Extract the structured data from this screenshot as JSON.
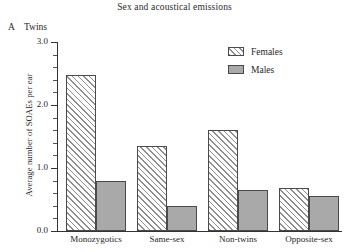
{
  "panel": {
    "letter": "A",
    "name": "Twins"
  },
  "chart_data": {
    "type": "bar",
    "title": "Sex and acoustical emissions",
    "xlabel": "",
    "ylabel": "Average number of SOAEs per ear",
    "categories": [
      "Monozygotics",
      "Same-sex",
      "Non-twins",
      "Opposite-sex"
    ],
    "series": [
      {
        "name": "Females",
        "values": [
          2.48,
          1.35,
          1.6,
          0.68
        ],
        "fill": "diagonal-hatch"
      },
      {
        "name": "Males",
        "values": [
          0.8,
          0.4,
          0.65,
          0.55
        ],
        "fill": "solid-gray"
      }
    ],
    "ylim": [
      0.0,
      3.0
    ],
    "ytick_labels": [
      "0.0",
      "1.0",
      "2.0",
      "3.0"
    ],
    "ytick_values": [
      0.0,
      1.0,
      2.0,
      3.0
    ],
    "yminor_step": 0.2,
    "grid": false,
    "legend_position": "top-right",
    "legend_entries": [
      "Females",
      "Males"
    ],
    "colors": {
      "hatch": "#8d8d8d",
      "males_fill": "#a9a9a9",
      "bar_outline": "#4a4a4a",
      "axis": "#333333",
      "text": "#1f1f1f"
    }
  }
}
